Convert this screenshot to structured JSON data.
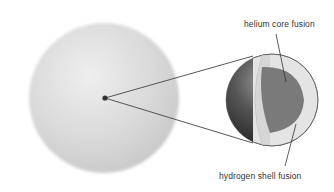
{
  "diagram": {
    "labels": {
      "core": "helium core fusion",
      "shell": "hydrogen shell fusion"
    },
    "colors": {
      "giant_star": "#d8d8d8",
      "core_dark": "#777777",
      "shell_light": "#e6e6e6",
      "sphere_dark": "#3a3a3a",
      "line": "#444444"
    }
  }
}
